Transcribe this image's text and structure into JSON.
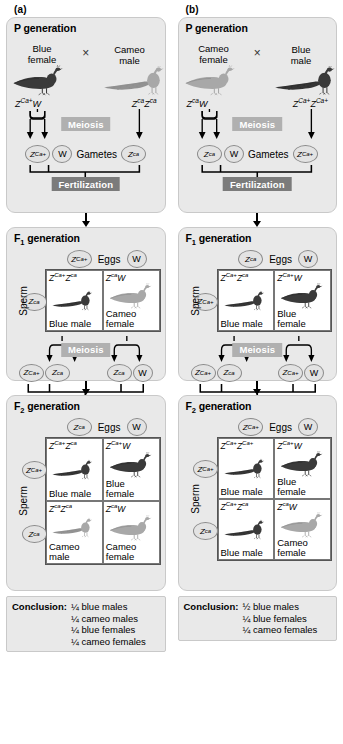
{
  "figure": {
    "words": {
      "eggs": "Eggs",
      "sperm": "Sperm",
      "gametes": "Gametes",
      "meiosis": "Meiosis",
      "fertilization": "Fertilization",
      "cross_symbol": "×",
      "conclusion_label": "Conclusion:"
    },
    "colors": {
      "panel_bg": "#e9e9e9",
      "panel_border": "#c9c9c9",
      "meiosis_banner": "#b0b0b0",
      "fertilization_banner": "#7b7b7b",
      "banner_text": "#ffffff",
      "cell_bg": "#ffffff",
      "circle_bg": "#e3e3e3",
      "circle_border": "#8a8a8a",
      "line": "#000000",
      "blue_bird": "#2b2b2b",
      "cameo_bird": "#8d8d8d"
    }
  },
  "panels": [
    {
      "letter": "(a)",
      "p_generation": {
        "title_main": "P",
        "title_sub": "",
        "title_rest": " generation",
        "female": {
          "label_line1": "Blue",
          "label_line2": "female",
          "bird": "blue-peahen",
          "genotype_html": "Z<sup>Ca+</sup>W"
        },
        "male": {
          "label_line1": "Cameo",
          "label_line2": "male",
          "bird": "cameo-peacock",
          "genotype_html": "Z<sup>ca</sup>Z<sup>ca</sup>"
        },
        "gametes": {
          "female_gametes": [
            "Z<sup>Ca+</sup>",
            "W"
          ],
          "male_gametes": [
            "Z<sup>ca</sup>"
          ]
        }
      },
      "f1_generation": {
        "title_main": "F",
        "title_sub": "1",
        "title_rest": " generation",
        "egg_gametes": [
          "Z<sup>Ca+</sup>",
          "W"
        ],
        "sperm_gametes": [
          "Z<sup>ca</sup>"
        ],
        "cells": [
          {
            "genotype_html": "Z<sup>Ca+</sup>Z<sup>ca</sup>",
            "name_line1": "Blue male",
            "name_line2": "",
            "bird": "blue-peacock"
          },
          {
            "genotype_html": "Z<sup>ca</sup>W",
            "name_line1": "Cameo",
            "name_line2": "female",
            "bird": "cameo-peahen"
          }
        ],
        "meiosis_gametes_left": [
          "Z<sup>Ca+</sup>",
          "Z<sup>ca</sup>"
        ],
        "meiosis_gametes_right": [
          "Z<sup>ca</sup>",
          "W"
        ]
      },
      "f2_generation": {
        "title_main": "F",
        "title_sub": "2",
        "title_rest": " generation",
        "egg_gametes": [
          "Z<sup>ca</sup>",
          "W"
        ],
        "sperm_gametes": [
          "Z<sup>Ca+</sup>",
          "Z<sup>ca</sup>"
        ],
        "cells": [
          {
            "genotype_html": "Z<sup>Ca+</sup>Z<sup>ca</sup>",
            "name_line1": "Blue male",
            "name_line2": "",
            "bird": "blue-peacock"
          },
          {
            "genotype_html": "Z<sup>Ca+</sup>W",
            "name_line1": "Blue",
            "name_line2": "female",
            "bird": "blue-peahen"
          },
          {
            "genotype_html": "Z<sup>ca</sup>Z<sup>ca</sup>",
            "name_line1": "Cameo",
            "name_line2": "male",
            "bird": "cameo-peacock"
          },
          {
            "genotype_html": "Z<sup>ca</sup>W",
            "name_line1": "Cameo",
            "name_line2": "female",
            "bird": "cameo-peahen"
          }
        ]
      },
      "conclusion": {
        "label": "Conclusion:",
        "items": [
          "¼ blue males",
          "¼ cameo males",
          "¼ blue females",
          "¼ cameo females"
        ]
      }
    },
    {
      "letter": "(b)",
      "p_generation": {
        "title_main": "P",
        "title_sub": "",
        "title_rest": " generation",
        "female": {
          "label_line1": "Cameo",
          "label_line2": "female",
          "bird": "cameo-peahen",
          "genotype_html": "Z<sup>ca</sup>W"
        },
        "male": {
          "label_line1": "Blue",
          "label_line2": "male",
          "bird": "blue-peacock",
          "genotype_html": "Z<sup>Ca+</sup>Z<sup>Ca+</sup>"
        },
        "gametes": {
          "female_gametes": [
            "Z<sup>ca</sup>",
            "W"
          ],
          "male_gametes": [
            "Z<sup>Ca+</sup>"
          ]
        }
      },
      "f1_generation": {
        "title_main": "F",
        "title_sub": "1",
        "title_rest": " generation",
        "egg_gametes": [
          "Z<sup>ca</sup>",
          "W"
        ],
        "sperm_gametes": [
          "Z<sup>Ca+</sup>"
        ],
        "cells": [
          {
            "genotype_html": "Z<sup>Ca+</sup>Z<sup>ca</sup>",
            "name_line1": "Blue male",
            "name_line2": "",
            "bird": "blue-peacock"
          },
          {
            "genotype_html": "Z<sup>Ca+</sup>W",
            "name_line1": "Blue",
            "name_line2": "female",
            "bird": "blue-peahen"
          }
        ],
        "meiosis_gametes_left": [
          "Z<sup>Ca+</sup>",
          "Z<sup>ca</sup>"
        ],
        "meiosis_gametes_right": [
          "Z<sup>Ca+</sup>",
          "W"
        ]
      },
      "f2_generation": {
        "title_main": "F",
        "title_sub": "2",
        "title_rest": " generation",
        "egg_gametes": [
          "Z<sup>Ca+</sup>",
          "W"
        ],
        "sperm_gametes": [
          "Z<sup>Ca+</sup>",
          "Z<sup>ca</sup>"
        ],
        "cells": [
          {
            "genotype_html": "Z<sup>Ca+</sup>Z<sup>Ca+</sup>",
            "name_line1": "Blue male",
            "name_line2": "",
            "bird": "blue-peacock"
          },
          {
            "genotype_html": "Z<sup>Ca+</sup>W",
            "name_line1": "Blue",
            "name_line2": "female",
            "bird": "blue-peahen"
          },
          {
            "genotype_html": "Z<sup>Ca+</sup>Z<sup>ca</sup>",
            "name_line1": "Blue male",
            "name_line2": "",
            "bird": "blue-peacock"
          },
          {
            "genotype_html": "Z<sup>ca</sup>W",
            "name_line1": "Cameo",
            "name_line2": "female",
            "bird": "cameo-peahen"
          }
        ]
      },
      "conclusion": {
        "label": "Conclusion:",
        "items": [
          "½ blue males",
          "¼ blue females",
          "¼ cameo females"
        ]
      }
    }
  ]
}
